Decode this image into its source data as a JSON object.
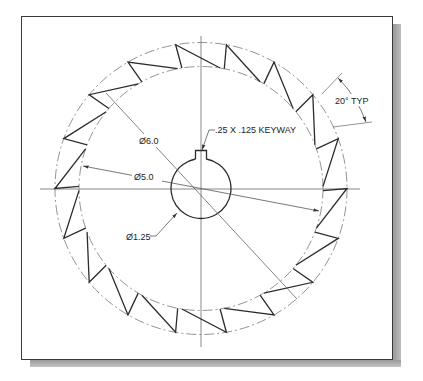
{
  "drawing": {
    "gear": {
      "center": [
        201,
        188.5
      ],
      "outer_radius": 146,
      "inner_radius": 122,
      "tooth_count": 18,
      "tooth_angle_deg": 20,
      "first_tooth_offset_deg": 10,
      "hub_radius": 30,
      "keyway_width_px": 11,
      "keyway_depth_px": 8
    },
    "colors": {
      "outline": "#2b2b2b",
      "centerline": "#6a6a6a",
      "dim": "#555555"
    },
    "labels": {
      "outer_diameter": "Ø6.0",
      "root_diameter": "Ø5.0",
      "bore_diameter": "Ø1.25",
      "keyway": ".25 X .125 KEYWAY",
      "tooth_angle": "20° TYP"
    }
  }
}
